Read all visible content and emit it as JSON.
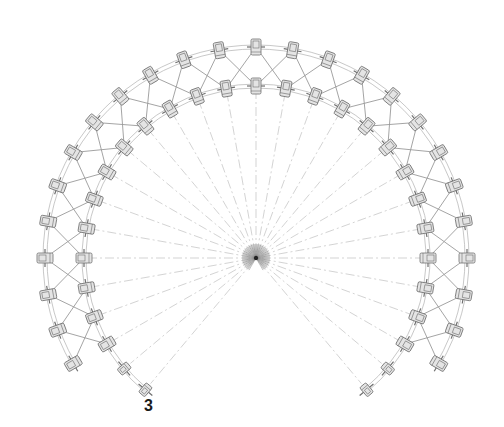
{
  "figure": {
    "label": "3"
  },
  "geometry": {
    "center": [
      256,
      258
    ],
    "outer_radius": 211,
    "inner_radius": 172,
    "node_step_deg": 10,
    "ring_start_deg": -120,
    "ring_end_deg": 120,
    "inner_extension_deg": [
      130,
      140
    ],
    "radial_line_count": 36
  },
  "colors": {
    "background": "#ffffff",
    "bracing": "#9a9a9a",
    "ring": "#b0b0b0",
    "radial": "#c8c8c8",
    "node_fill": "#e4e4e4",
    "node_stroke": "#6e6e6e",
    "label": "#1a1a1a"
  }
}
